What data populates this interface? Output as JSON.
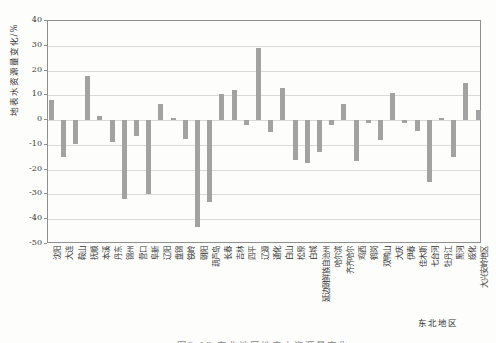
{
  "figure": {
    "caption": "图2-12 东北地区地表水资源量变化"
  },
  "chart_data": {
    "type": "bar",
    "title": "",
    "ylabel": "地表水资源量变化/%",
    "xlabel": "东北地区",
    "ylim": [
      -50,
      40
    ],
    "yticks": [
      40,
      30,
      20,
      10,
      0,
      -10,
      -20,
      -30,
      -40,
      -50
    ],
    "grid": true,
    "legend": "none",
    "bar_color": "#a2a2a2",
    "axis_color": "#8f8f8f",
    "gridline_color": "#d9d9d9",
    "categories": [
      "沈阳",
      "大连",
      "鞍山",
      "抚顺",
      "本溪",
      "丹东",
      "锦州",
      "营口",
      "阜新",
      "辽阳",
      "盘锦",
      "铁岭",
      "朝阳",
      "葫芦岛",
      "长春",
      "吉林",
      "四平",
      "辽源",
      "通化",
      "白山",
      "松原",
      "白城",
      "延边朝鲜族自治州",
      "哈尔滨",
      "齐齐哈尔",
      "鸡西",
      "鹤岗",
      "双鸭山",
      "大庆",
      "伊春",
      "佳木斯",
      "七台河",
      "牡丹江",
      "黑河",
      "绥化",
      "大兴安岭地区"
    ],
    "values": [
      8,
      -15,
      -9.5,
      18,
      1.5,
      -9,
      -32,
      -6.5,
      -30,
      6.5,
      1,
      -7.5,
      -43,
      -33,
      10.5,
      12,
      -2,
      29,
      -5,
      13,
      -16,
      -17.5,
      -13,
      -2,
      6.5,
      -16.5,
      -1,
      -8,
      11,
      -1,
      -4.5,
      -25,
      1,
      -15,
      15,
      4
    ]
  }
}
